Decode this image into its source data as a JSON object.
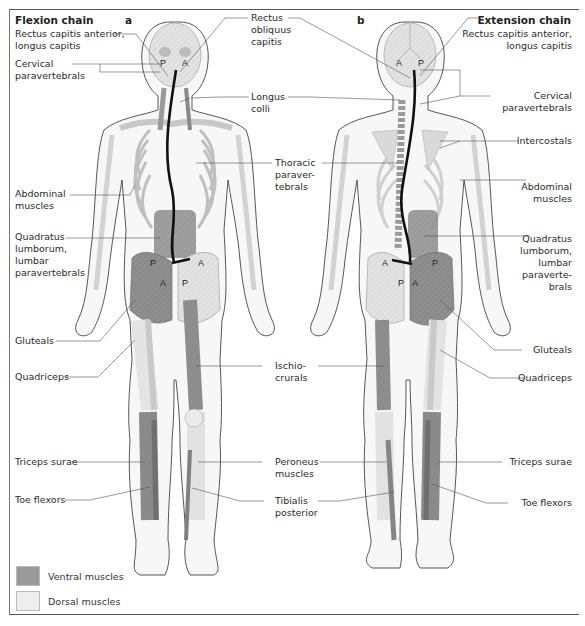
{
  "figure": {
    "left_title": "Flexion chain",
    "right_title": "Extension chain",
    "panel_a": "a",
    "panel_b": "b"
  },
  "colors": {
    "ventral": "#9a9a9a",
    "dorsal": "#e6e6e6",
    "bone": "#d8d8d8",
    "outline": "#444444",
    "chain_line": "#111111"
  },
  "labels_left": {
    "rectus_capitis_anterior": "Rectus capitis anterior,\nlongus capitis",
    "cervical_paravertebrals": "Cervical\nparavertebrals",
    "abdominal_muscles": "Abdominal\nmuscles",
    "quadratus_lumborum": "Quadratus\nlumborum,\nlumbar\nparavertebrals",
    "gluteals": "Gluteals",
    "quadriceps": "Quadriceps",
    "triceps_surae": "Triceps surae",
    "toe_flexors": "Toe flexors"
  },
  "labels_center": {
    "rectus_obliquus_capitis": "Rectus\nobliquus\ncapitis",
    "longus_colli": "Longus\ncolli",
    "thoracic_paravertebrals": "Thoracic\nparaver-\ntebrals",
    "ischiocrurals": "Ischio-\ncrurals",
    "peroneus_muscles": "Peroneus\nmuscles",
    "tibialis_posterior": "Tibialis\nposterior"
  },
  "labels_right": {
    "rectus_capitis_anterior": "Rectus capitis anterior,\nlongus capitis",
    "cervical_paravertebrals": "Cervical\nparavertebrals",
    "intercostals": "Intercostals",
    "abdominal_muscles": "Abdominal\nmuscles",
    "quadratus_lumborum": "Quadratus\nlumborum,\nlumbar\nparaverte-\nbrals",
    "gluteals": "Gluteals",
    "quadriceps": "Quadriceps",
    "triceps_surae": "Triceps surae",
    "toe_flexors": "Toe flexors"
  },
  "figure_markers": {
    "left_head": [
      "P",
      "A"
    ],
    "left_pelvis_top": [
      "P",
      "A"
    ],
    "left_pelvis_bottom": [
      "A",
      "P"
    ],
    "right_head": [
      "A",
      "P"
    ],
    "right_pelvis_top": [
      "A",
      "P"
    ],
    "right_pelvis_bottom": [
      "P",
      "A"
    ]
  },
  "legend": [
    {
      "label": "Ventral muscles",
      "color": "#9a9a9a"
    },
    {
      "label": "Dorsal muscles",
      "color": "#eeeeee"
    }
  ]
}
